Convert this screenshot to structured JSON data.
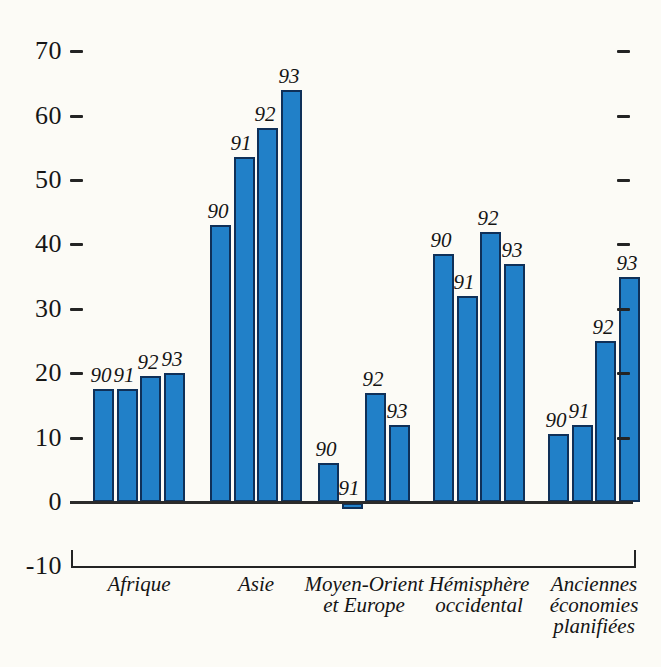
{
  "figure": {
    "background": "#fcfbf6",
    "bar_fill": "#2180c8",
    "bar_border": "#0f3058",
    "axis_color": "#2b2b2b",
    "text_color": "#141414"
  },
  "chart_data": {
    "type": "bar",
    "title": "",
    "xlabel": "",
    "ylabel": "",
    "grid": false,
    "legend": false,
    "categories": [
      "90",
      "91",
      "92",
      "93"
    ],
    "groups": [
      {
        "label": "Afrique",
        "label_lines": [
          "Afrique"
        ],
        "values": [
          17.5,
          17.5,
          19.5,
          20
        ]
      },
      {
        "label": "Asie",
        "label_lines": [
          "Asie"
        ],
        "values": [
          43,
          53.5,
          58,
          64
        ]
      },
      {
        "label": "Moyen-Orient et Europe",
        "label_lines": [
          "Moyen-Orient",
          "et Europe"
        ],
        "values": [
          6,
          -1,
          17,
          12
        ]
      },
      {
        "label": "Hémisphère occidental",
        "label_lines": [
          "Hémisphère",
          "occidental"
        ],
        "values": [
          38.5,
          32,
          42,
          37
        ]
      },
      {
        "label": "Anciennes économies planifiées",
        "label_lines": [
          "Anciennes",
          "économies",
          "planifiées"
        ],
        "values": [
          10.5,
          12,
          25,
          35
        ]
      }
    ],
    "y_axis": {
      "min": -10,
      "max": 70,
      "tick_labels": [
        "70",
        "60",
        "50",
        "40",
        "30",
        "20",
        "10",
        "0",
        "-10"
      ],
      "tick_values": [
        70,
        60,
        50,
        40,
        30,
        20,
        10,
        0,
        -10
      ],
      "left_dash_tick_values": [
        70,
        60,
        50,
        40,
        30,
        20,
        10
      ],
      "right_dash_tick_values": [
        70,
        60,
        50,
        40,
        30,
        20,
        10
      ]
    }
  }
}
